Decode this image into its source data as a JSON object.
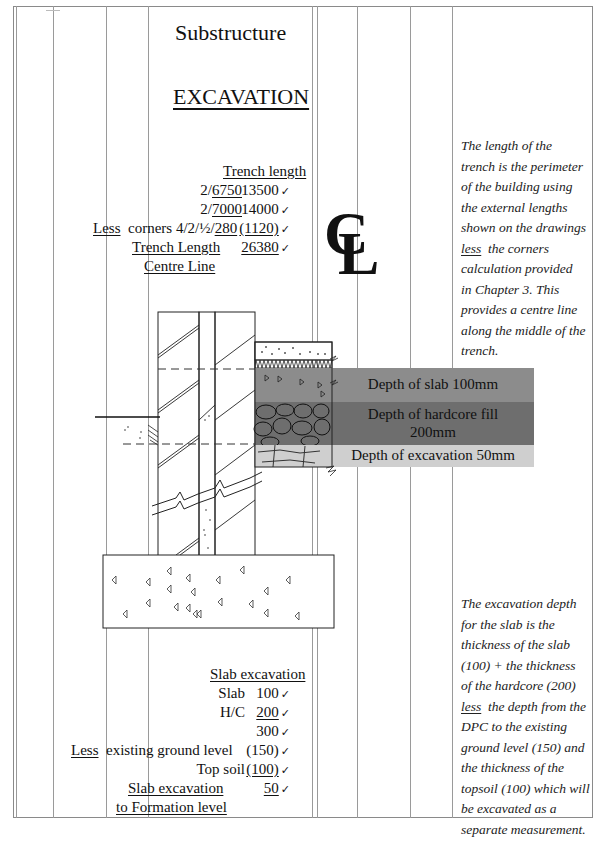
{
  "header": {
    "title": "Substructure",
    "heading": "EXCAVATION"
  },
  "trench": {
    "heading": "Trench length",
    "rows": [
      {
        "label": "2/6750",
        "value": "13500",
        "check": "✓"
      },
      {
        "label": "2/7000",
        "value": "14000",
        "check": "✓"
      },
      {
        "label_prefix": "Less",
        "label": "corners 4/2/½/280",
        "value": "(1120)",
        "check": "✓"
      },
      {
        "label": "Trench Length",
        "value": "26380",
        "check": "✓"
      }
    ],
    "label_line2": "Centre Line"
  },
  "centre_line_symbol": {
    "c": "C",
    "l": "L"
  },
  "notes": {
    "trench_note": [
      "The length of the",
      "trench is the perimeter",
      "of the building using",
      "the external lengths",
      "shown on the drawings",
      "less",
      "the corners",
      "calculation provided",
      "in Chapter 3. This",
      "provides a centre line",
      "along the middle of the",
      "trench."
    ],
    "slab_note": [
      "The excavation depth",
      "for the slab is the",
      "thickness of the slab",
      "(100) + the thickness",
      "of the hardcore (200)",
      "less",
      "the depth from the",
      "DPC to the existing",
      "ground level (150) and",
      "the thickness of the",
      "topsoil (100) which will",
      "be excavated as a",
      "separate measurement."
    ]
  },
  "diagram": {
    "bands": [
      {
        "label": "Depth of slab 100mm",
        "color": "#8c8c8c"
      },
      {
        "label": "Depth of hardcore fill",
        "label2": "200mm",
        "color": "#6e6e6e"
      },
      {
        "label": "Depth of excavation 50mm",
        "color": "#cfcfcf"
      }
    ]
  },
  "slab": {
    "heading": "Slab excavation",
    "rows": [
      {
        "label": "Slab",
        "value": "100",
        "check": "✓"
      },
      {
        "label": "H/C",
        "value": "200",
        "check": "✓"
      },
      {
        "label": "",
        "value": "300",
        "check": "✓"
      },
      {
        "label_prefix": "Less",
        "label": "existing ground level",
        "value": "(150)",
        "check": "✓"
      },
      {
        "label": "Top soil",
        "value": "(100)",
        "check": "✓"
      },
      {
        "label": "Slab excavation",
        "value": "50",
        "check": "✓"
      }
    ],
    "label_line2": "to Formation level"
  }
}
